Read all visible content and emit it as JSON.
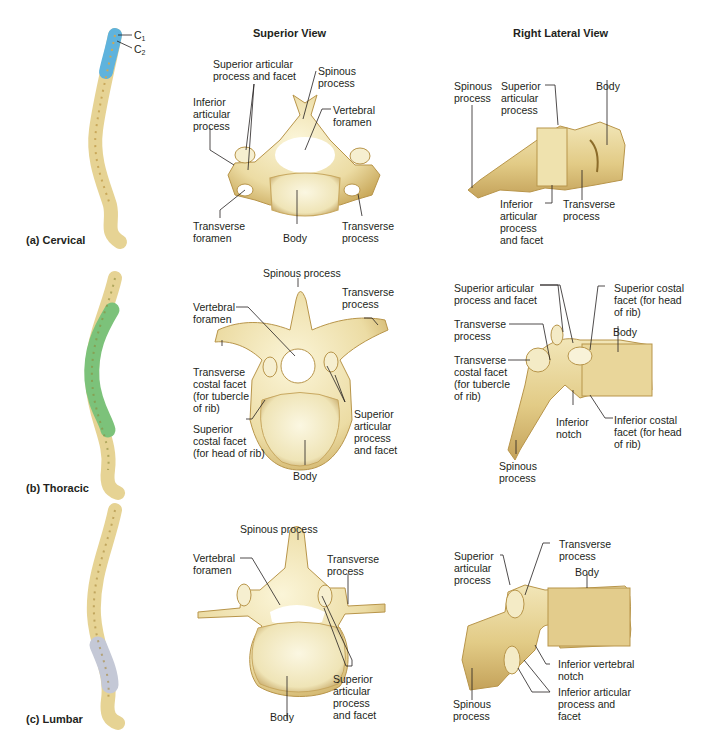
{
  "headers": {
    "superior": "Superior View",
    "lateral": "Right Lateral View"
  },
  "colors": {
    "bone": "#efe3b0",
    "bone_shade": "#c9a85a",
    "cervical_highlight": "#5fb3dd",
    "thoracic_highlight": "#7cc27a",
    "lumbar_highlight": "#c4c8d6",
    "leader_line": "#231f20"
  },
  "rows": [
    {
      "id": "cervical",
      "title": "(a)  Cervical",
      "spine_labels": [
        "C1",
        "C2"
      ],
      "spine_c1": "C",
      "spine_c1_sub": "1",
      "spine_c2": "C",
      "spine_c2_sub": "2",
      "superior": {
        "sup_art": "Superior articular\nprocess and facet",
        "spinous": "Spinous\nprocess",
        "inf_art": "Inferior\narticular\nprocess",
        "vert_for": "Vertebral\nforamen",
        "trans_for": "Transverse\nforamen",
        "body": "Body",
        "trans_proc": "Transverse\nprocess"
      },
      "lateral": {
        "spinous": "Spinous\nprocess",
        "sup_art": "Superior\narticular\nprocess",
        "body": "Body",
        "inf_art": "Inferior\narticular\nprocess\nand facet",
        "trans_proc": "Transverse\nprocess"
      }
    },
    {
      "id": "thoracic",
      "title": "(b)  Thoracic",
      "superior": {
        "spinous": "Spinous process",
        "trans_proc": "Transverse\nprocess",
        "vert_for": "Vertebral\nforamen",
        "trans_costal": "Transverse\ncostal facet\n(for tubercle\nof rib)",
        "sup_costal": "Superior\ncostal facet\n(for head of rib)",
        "sup_art": "Superior\narticular\nprocess\nand facet",
        "body": "Body"
      },
      "lateral": {
        "sup_art": "Superior articular\nprocess and facet",
        "sup_costal": "Superior costal\nfacet (for head\nof rib)",
        "trans_proc": "Transverse\nprocess",
        "body": "Body",
        "trans_costal": "Transverse\ncostal facet\n(for tubercle\nof rib)",
        "inf_notch": "Inferior\nnotch",
        "inf_costal": "Inferior costal\nfacet (for head\nof rib)",
        "spinous": "Spinous\nprocess"
      }
    },
    {
      "id": "lumbar",
      "title": "(c)  Lumbar",
      "superior": {
        "spinous": "Spinous process",
        "vert_for": "Vertebral\nforamen",
        "trans_proc": "Transverse\nprocess",
        "sup_art": "Superior\narticular\nprocess\nand facet",
        "body": "Body"
      },
      "lateral": {
        "sup_art": "Superior\narticular\nprocess",
        "trans_proc": "Transverse\nprocess",
        "body": "Body",
        "inf_vert_notch": "Inferior vertebral\nnotch",
        "inf_art": "Inferior articular\nprocess and\nfacet",
        "spinous": "Spinous\nprocess"
      }
    }
  ]
}
